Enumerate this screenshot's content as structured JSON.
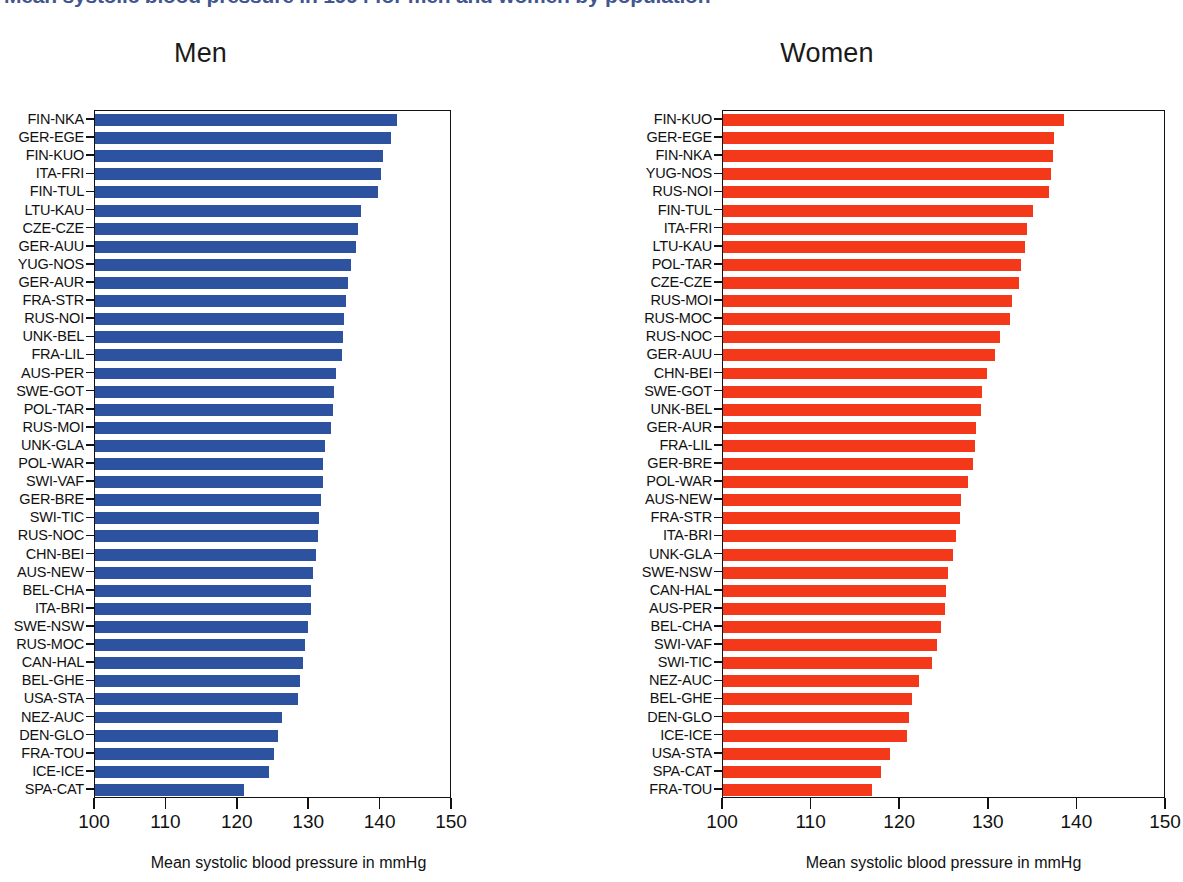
{
  "figure": {
    "suptitle": "Mean systolic blood pressure in 1994 for men and women by population",
    "suptitle_color": "#41558e",
    "xlabel": "Mean systolic blood pressure in mmHg",
    "xticks": [
      100,
      110,
      120,
      130,
      140,
      150
    ],
    "xlim": [
      100,
      150
    ],
    "men_color": "#2c52a0",
    "women_color": "#f4381a"
  },
  "panels": [
    {
      "key": "men",
      "title": "Men",
      "xlabel": "Mean systolic blood pressure in mmHg"
    },
    {
      "key": "women",
      "title": "Women",
      "xlabel": "Mean systolic blood pressure in mmHg"
    }
  ],
  "chart_data": [
    {
      "type": "bar",
      "orientation": "horizontal",
      "title": "Men",
      "xlabel": "Mean systolic blood pressure in mmHg",
      "ylabel": "",
      "xlim": [
        100,
        150
      ],
      "xticks": [
        100,
        110,
        120,
        130,
        140,
        150
      ],
      "grid": false,
      "legend": "none",
      "color": "#2c52a0",
      "categories": [
        "FIN-NKA",
        "GER-EGE",
        "FIN-KUO",
        "ITA-FRI",
        "FIN-TUL",
        "LTU-KAU",
        "CZE-CZE",
        "GER-AUU",
        "YUG-NOS",
        "GER-AUR",
        "FRA-STR",
        "RUS-NOI",
        "UNK-BEL",
        "FRA-LIL",
        "AUS-PER",
        "SWE-GOT",
        "POL-TAR",
        "RUS-MOI",
        "UNK-GLA",
        "POL-WAR",
        "SWI-VAF",
        "GER-BRE",
        "SWI-TIC",
        "RUS-NOC",
        "CHN-BEI",
        "AUS-NEW",
        "BEL-CHA",
        "ITA-BRI",
        "SWE-NSW",
        "RUS-MOC",
        "CAN-HAL",
        "BEL-GHE",
        "USA-STA",
        "NEZ-AUC",
        "DEN-GLO",
        "FRA-TOU",
        "ICE-ICE",
        "SPA-CAT"
      ],
      "values": [
        142.3,
        141.5,
        140.4,
        140.0,
        139.6,
        137.2,
        136.8,
        136.6,
        135.9,
        135.4,
        135.1,
        134.9,
        134.8,
        134.6,
        133.8,
        133.5,
        133.3,
        133.0,
        132.2,
        132.0,
        131.9,
        131.7,
        131.4,
        131.2,
        131.0,
        130.5,
        130.3,
        130.2,
        129.8,
        129.4,
        129.1,
        128.7,
        128.4,
        126.2,
        125.6,
        125.1,
        124.3,
        120.8
      ]
    },
    {
      "type": "bar",
      "orientation": "horizontal",
      "title": "Women",
      "xlabel": "Mean systolic blood pressure in mmHg",
      "ylabel": "",
      "xlim": [
        100,
        150
      ],
      "xticks": [
        100,
        110,
        120,
        130,
        140,
        150
      ],
      "grid": false,
      "legend": "none",
      "color": "#f4381a",
      "categories": [
        "FIN-KUO",
        "GER-EGE",
        "FIN-NKA",
        "YUG-NOS",
        "RUS-NOI",
        "FIN-TUL",
        "ITA-FRI",
        "LTU-KAU",
        "POL-TAR",
        "CZE-CZE",
        "RUS-MOI",
        "RUS-MOC",
        "RUS-NOC",
        "GER-AUU",
        "CHN-BEI",
        "SWE-GOT",
        "UNK-BEL",
        "GER-AUR",
        "FRA-LIL",
        "GER-BRE",
        "POL-WAR",
        "AUS-NEW",
        "FRA-STR",
        "ITA-BRI",
        "UNK-GLA",
        "SWE-NSW",
        "CAN-HAL",
        "AUS-PER",
        "BEL-CHA",
        "SWI-VAF",
        "SWI-TIC",
        "NEZ-AUC",
        "BEL-GHE",
        "DEN-GLO",
        "ICE-ICE",
        "USA-STA",
        "SPA-CAT",
        "FRA-TOU"
      ],
      "values": [
        138.5,
        137.4,
        137.2,
        137.0,
        136.8,
        135.0,
        134.3,
        134.1,
        133.6,
        133.4,
        132.6,
        132.4,
        131.3,
        130.7,
        129.8,
        129.2,
        129.1,
        128.6,
        128.4,
        128.2,
        127.7,
        126.9,
        126.8,
        126.3,
        126.0,
        125.4,
        125.2,
        125.0,
        124.6,
        124.2,
        123.6,
        122.1,
        121.3,
        121.0,
        120.8,
        118.8,
        117.8,
        116.8
      ]
    }
  ]
}
